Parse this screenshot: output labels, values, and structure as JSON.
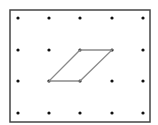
{
  "diagram": {
    "type": "geoboard-dot-grid",
    "grid": {
      "columns": 5,
      "rows": 4,
      "x_positions": [
        18,
        49,
        80,
        112,
        143
      ],
      "y_positions": [
        18,
        50,
        81,
        113
      ]
    },
    "frame": {
      "x": 10,
      "y": 10,
      "width": 140,
      "height": 112,
      "stroke": "#444444"
    },
    "dot_color": "#111111",
    "shape": {
      "name": "parallelogram",
      "vertices_grid": [
        [
          2,
          1
        ],
        [
          3,
          1
        ],
        [
          2,
          2
        ],
        [
          1,
          2
        ]
      ],
      "stroke": "#8a8a8a"
    }
  }
}
